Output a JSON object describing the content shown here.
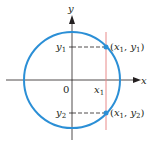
{
  "diagram": {
    "axes": {
      "x_label": "x",
      "y_label": "y",
      "origin_label": "0"
    },
    "circle": {
      "color": "#2b8fd6",
      "center": [
        72,
        80
      ],
      "radius": 48
    },
    "vertical_line": {
      "color": "#e88a8a",
      "x_label_base": "x",
      "x_label_sub": "1"
    },
    "ticks": {
      "y1_base": "y",
      "y1_sub": "1",
      "y2_base": "y",
      "y2_sub": "2"
    },
    "points": [
      {
        "label_open": "(",
        "x_base": "x",
        "x_sub": "1",
        "sep": ", ",
        "y_base": "y",
        "y_sub": "1",
        "label_close": ")"
      },
      {
        "label_open": "(",
        "x_base": "x",
        "x_sub": "1",
        "sep": ", ",
        "y_base": "y",
        "y_sub": "2",
        "label_close": ")"
      }
    ],
    "colors": {
      "axis": "#231f20",
      "circle": "#2b8fd6",
      "line": "#e88a8a",
      "point": "#2b8fd6"
    }
  }
}
